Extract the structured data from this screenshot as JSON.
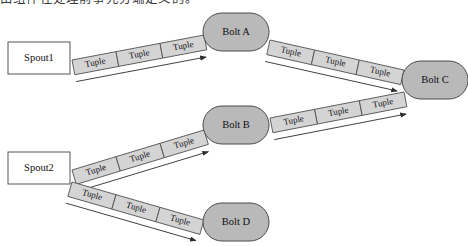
{
  "caption": {
    "text": "由组件在处理前事先分端定义的。"
  },
  "diagram": {
    "colors": {
      "bolt_fill": "#b9b9b9",
      "bolt_stroke": "#4a4a4a",
      "spout_fill": "#ffffff",
      "spout_stroke": "#555555",
      "tuple_fill": "#d4d4d4",
      "tuple_stroke": "#4f4f4f",
      "arrow": "#2b2b2b"
    },
    "nodes": [
      {
        "id": "spout1",
        "label": "Spout1",
        "type": "spout",
        "x": 8,
        "y": 42,
        "w": 62,
        "h": 32
      },
      {
        "id": "spout2",
        "label": "Spout2",
        "type": "spout",
        "x": 8,
        "y": 152,
        "w": 62,
        "h": 32
      },
      {
        "id": "boltA",
        "label": "Bolt A",
        "type": "bolt",
        "cx": 236,
        "cy": 32,
        "rx": 33,
        "ry": 19
      },
      {
        "id": "boltB",
        "label": "Bolt B",
        "type": "bolt",
        "cx": 236,
        "cy": 125,
        "rx": 33,
        "ry": 19
      },
      {
        "id": "boltC",
        "label": "Bolt C",
        "type": "bolt",
        "cx": 435,
        "cy": 80,
        "rx": 33,
        "ry": 19
      },
      {
        "id": "boltD",
        "label": "Bolt D",
        "type": "bolt",
        "cx": 236,
        "cy": 222,
        "rx": 33,
        "ry": 19
      }
    ],
    "streams": [
      {
        "id": "spout1-boltA",
        "from": "spout1",
        "to": "boltA",
        "tuples": [
          "Tuple",
          "Tuple",
          "Tuple"
        ],
        "x1": 72,
        "y1": 60,
        "x2": 204,
        "y2": 35
      },
      {
        "id": "boltA-boltC",
        "from": "boltA",
        "to": "boltC",
        "tuples": [
          "Tuple",
          "Tuple",
          "Tuple"
        ],
        "x1": 270,
        "y1": 40,
        "x2": 404,
        "y2": 70
      },
      {
        "id": "spout2-boltB",
        "from": "spout2",
        "to": "boltB",
        "tuples": [
          "Tuple",
          "Tuple",
          "Tuple"
        ],
        "x1": 72,
        "y1": 170,
        "x2": 204,
        "y2": 130
      },
      {
        "id": "boltB-boltC",
        "from": "boltB",
        "to": "boltC",
        "tuples": [
          "Tuple",
          "Tuple",
          "Tuple"
        ],
        "x1": 270,
        "y1": 118,
        "x2": 404,
        "y2": 92
      },
      {
        "id": "spout2-boltD",
        "from": "spout2",
        "to": "boltD",
        "tuples": [
          "Tuple",
          "Tuple",
          "Tuple"
        ],
        "x1": 72,
        "y1": 182,
        "x2": 204,
        "y2": 220
      }
    ]
  }
}
